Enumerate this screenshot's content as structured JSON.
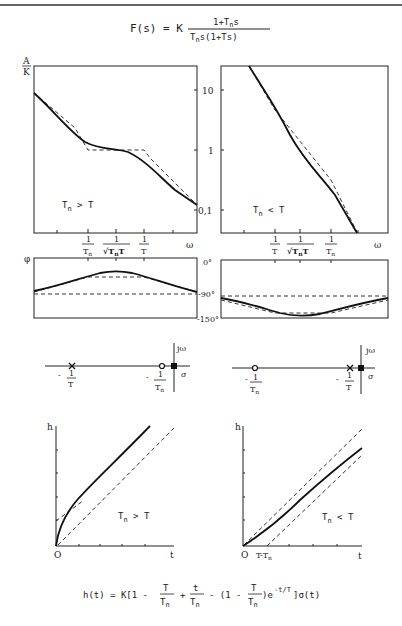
{
  "title_formula": {
    "lhs": "F(s) = K",
    "numerator": "1+T",
    "numerator_sub": "n",
    "numerator_tail": "s",
    "denominator": "T",
    "denominator_sub": "n",
    "denominator_tail": "s(1+Ts)"
  },
  "magnitude_plots": {
    "y_axis_label_num": "A",
    "y_axis_label_den": "K",
    "y_ticks": [
      "10",
      "1",
      "0,1"
    ],
    "x_axis_label": "ω",
    "left": {
      "condition": "T",
      "condition_sub": "n",
      "condition_tail": " > T",
      "freq_labels": [
        {
          "num": "1",
          "den": "T",
          "den_sub": "n"
        },
        {
          "num": "1",
          "den": "√T",
          "den_sub": "n",
          "den_tail": "T"
        },
        {
          "num": "1",
          "den": "T",
          "den_sub": ""
        }
      ]
    },
    "right": {
      "condition": "T",
      "condition_sub": "n",
      "condition_tail": " < T",
      "freq_labels": [
        {
          "num": "1",
          "den": "T",
          "den_sub": ""
        },
        {
          "num": "1",
          "den": "√T",
          "den_sub": "n",
          "den_tail": "T"
        },
        {
          "num": "1",
          "den": "T",
          "den_sub": "n"
        }
      ]
    }
  },
  "phase_plots": {
    "y_axis_label": "φ",
    "y_ticks": [
      "0°",
      "-90°",
      "-150°"
    ]
  },
  "pole_zero_plots": {
    "imag_axis_label": "jω",
    "real_axis_label": "σ",
    "left": {
      "pole_label": {
        "sign": "-",
        "num": "1",
        "den": "T",
        "den_sub": ""
      },
      "zero_label": {
        "sign": "-",
        "num": "1",
        "den": "T",
        "den_sub": "n"
      }
    },
    "right": {
      "zero_label": {
        "sign": "-",
        "num": "1",
        "den": "T",
        "den_sub": "n"
      },
      "pole_label": {
        "sign": "-",
        "num": "1",
        "den": "T",
        "den_sub": ""
      }
    }
  },
  "step_response_plots": {
    "y_axis_label": "h",
    "x_axis_label": "t",
    "origin_label": "O",
    "left": {
      "condition": "T",
      "condition_sub": "n",
      "condition_tail": " > T"
    },
    "right": {
      "condition": "T",
      "condition_sub": "n",
      "condition_tail": " < T",
      "x_marker": "T-T",
      "x_marker_sub": "n"
    }
  },
  "bottom_formula": {
    "lhs": "h(t) = K[1 -",
    "f1_num": "T",
    "f1_den": "T",
    "f1_den_sub": "n",
    "plus": "+",
    "f2_num": "t",
    "f2_den": "T",
    "f2_den_sub": "n",
    "minus": "-  (1 -",
    "f3_num": "T",
    "f3_den": "T",
    "f3_den_sub": "n",
    "tail": ")e",
    "exp": "-t/T",
    "end": "]σ(t)"
  }
}
